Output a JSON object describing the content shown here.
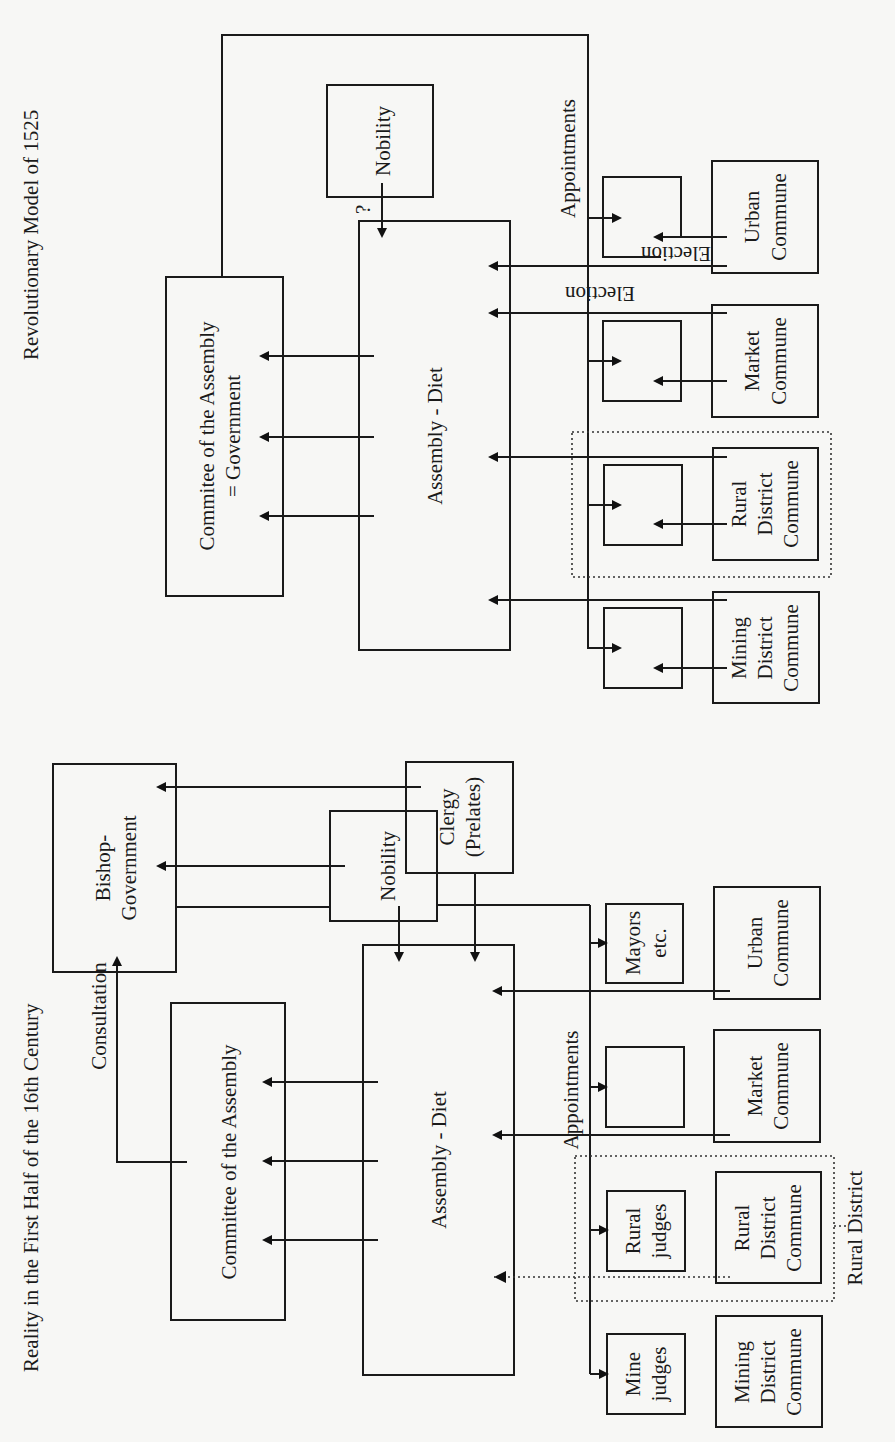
{
  "diagram": {
    "orientation": "rotated 90 degrees counter-clockwise (reads bottom-to-top)",
    "top_model": {
      "title": "Revolutionary Model of 1525",
      "committee": {
        "line1": "Commitee of the Assembly",
        "line2": "= Government"
      },
      "assembly": "Assembly - Diet",
      "nobility": "Nobility",
      "question_mark": "?",
      "appointments": "Appointments",
      "election_inner": "Election",
      "election_outer": "Election",
      "communes": [
        {
          "line1": "Urban",
          "line2": "Commune",
          "line3": ""
        },
        {
          "line1": "Market",
          "line2": "Commune",
          "line3": ""
        },
        {
          "line1": "Rural",
          "line2": "District",
          "line3": "Commune"
        },
        {
          "line1": "Mining",
          "line2": "District",
          "line3": "Commune"
        }
      ]
    },
    "bottom_model": {
      "title": "Reality in the First Half of the 16th Century",
      "bishop_government": {
        "line1": "Bishop-",
        "line2": "Government"
      },
      "consultation": "Consultation",
      "committee": "Committee of the Assembly",
      "assembly": "Assembly - Diet",
      "nobility": "Nobility",
      "clergy": {
        "line1": "Clergy",
        "line2": "(Prelates)"
      },
      "appointments": "Appointments",
      "officials": [
        {
          "line1": "Mayors",
          "line2": "etc."
        },
        {
          "line1": "",
          "line2": ""
        },
        {
          "line1": "Rural",
          "line2": "judges"
        },
        {
          "line1": "Mine",
          "line2": "judges"
        }
      ],
      "communes": [
        {
          "line1": "Urban",
          "line2": "Commune",
          "line3": ""
        },
        {
          "line1": "Market",
          "line2": "Commune",
          "line3": ""
        },
        {
          "line1": "Rural",
          "line2": "District",
          "line3": "Commune"
        },
        {
          "line1": "Mining",
          "line2": "District",
          "line3": "Commune"
        }
      ],
      "rural_district_label": "Rural District"
    }
  }
}
